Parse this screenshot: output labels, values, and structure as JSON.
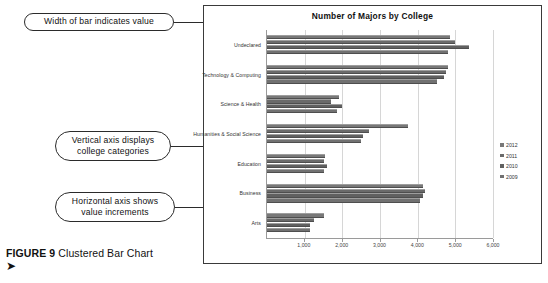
{
  "figure": {
    "label": "FIGURE 9",
    "caption": "Clustered Bar Chart",
    "arrow_glyph": "➤"
  },
  "annotations": [
    {
      "id": "width-of-bar",
      "text": "Width of bar indicates value"
    },
    {
      "id": "vertical-axis",
      "text": "Vertical axis displays college categories"
    },
    {
      "id": "horizontal-axis",
      "text": "Horizontal axis shows value increments"
    }
  ],
  "annotation_lines": {
    "width_of_bar_line1": "Width of bar indicates value",
    "vertical_axis_line1": "Vertical axis displays",
    "vertical_axis_line2": "college categories",
    "horizontal_axis_line1": "Horizontal axis shows",
    "horizontal_axis_line2": "value increments"
  },
  "chart_data": {
    "type": "bar",
    "orientation": "horizontal",
    "title": "Number of Majors by College",
    "xlabel": "",
    "ylabel": "",
    "xlim": [
      0,
      6000
    ],
    "ticks": [
      "1,000",
      "2,000",
      "3,000",
      "4,000",
      "5,000",
      "6,000"
    ],
    "tick_values": [
      1000,
      2000,
      3000,
      4000,
      5000,
      6000
    ],
    "grid": true,
    "legend_position": "right",
    "categories": [
      "Undeclared",
      "Technology & Computing",
      "Science & Health",
      "Humanities & Social Science",
      "Education",
      "Business",
      "Arts"
    ],
    "series": [
      {
        "name": "2012",
        "color": "#787878",
        "values": [
          4850,
          4800,
          1900,
          3750,
          1550,
          4150,
          1500
        ]
      },
      {
        "name": "2011",
        "color": "#6a6a6a",
        "values": [
          5000,
          4750,
          1700,
          2700,
          1500,
          4200,
          1250
        ]
      },
      {
        "name": "2010",
        "color": "#606060",
        "values": [
          5350,
          4700,
          2000,
          2550,
          1600,
          4150,
          1150
        ]
      },
      {
        "name": "2009",
        "color": "#717171",
        "values": [
          4800,
          4500,
          1850,
          2500,
          1500,
          4050,
          1150
        ]
      }
    ]
  }
}
